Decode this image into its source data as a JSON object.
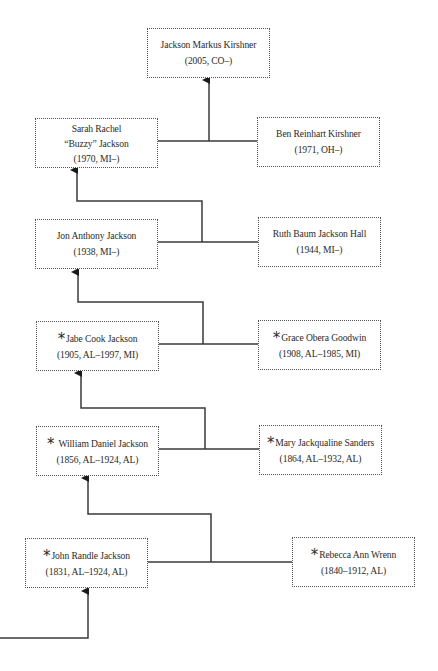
{
  "diagram": {
    "type": "family-tree",
    "marker_legend_symbol": "*",
    "line_color": "#3a3a3a",
    "people": {
      "jackson_markus": {
        "name": "Jackson Markus Kirshner",
        "dates": "(2005, CO–)",
        "starred": false
      },
      "sarah": {
        "name_line1": "Sarah Rachel",
        "name_line2": "“Buzzy” Jackson",
        "dates": "(1970, MI–)",
        "starred": false
      },
      "ben": {
        "name": "Ben Reinhart Kirshner",
        "dates": "(1971, OH–)",
        "starred": false
      },
      "jon": {
        "name": "Jon Anthony Jackson",
        "dates": "(1938, MI–)",
        "starred": false
      },
      "ruth": {
        "name": "Ruth Baum Jackson Hall",
        "dates": "(1944, MI–)",
        "starred": false
      },
      "jabe": {
        "star": "*",
        "name": "Jabe Cook Jackson",
        "dates": "(1905, AL–1997, MI)",
        "starred": true
      },
      "grace": {
        "star": "*",
        "name": "Grace Obera Goodwin",
        "dates": "(1908, AL–1985, MI)",
        "starred": true
      },
      "william": {
        "star": "*",
        "name": "William Daniel Jackson",
        "dates": "(1856, AL–1924, AL)",
        "starred": true
      },
      "mary": {
        "star": "*",
        "name": "Mary Jackqualine Sanders",
        "dates": "(1864, AL–1932, AL)",
        "starred": true
      },
      "john": {
        "star": "*",
        "name": "John Randle Jackson",
        "dates": "(1831, AL–1924, AL)",
        "starred": true
      },
      "rebecca": {
        "star": "*",
        "name": "Rebecca Ann Wrenn",
        "dates": "(1840–1912, AL)",
        "starred": true
      }
    },
    "couples": [
      {
        "left": "sarah",
        "right": "ben",
        "child": "jackson_markus"
      },
      {
        "left": "jon",
        "right": "ruth",
        "child": "sarah"
      },
      {
        "left": "jabe",
        "right": "grace",
        "child": "jon"
      },
      {
        "left": "william",
        "right": "mary",
        "child": "jabe"
      },
      {
        "left": "john",
        "right": "rebecca",
        "child": "william"
      }
    ]
  }
}
